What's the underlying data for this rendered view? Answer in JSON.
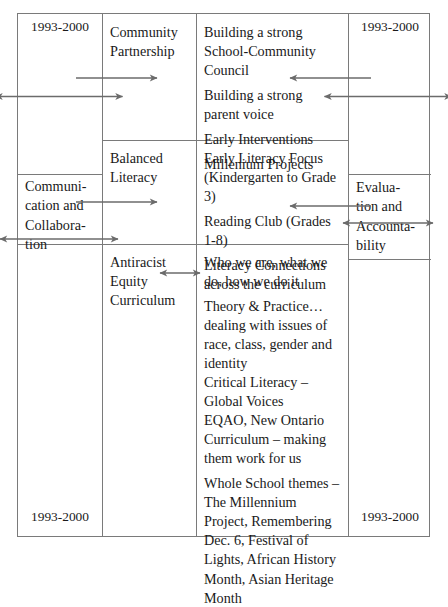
{
  "document": {
    "type": "table-diagram",
    "title": "School improvement planning framework table",
    "colors": {
      "border": "#7a7a7a",
      "text": "#1a1a1a",
      "arrow": "#6b6b6b",
      "background": "#ffffff"
    }
  },
  "table": {
    "left_column": {
      "year_top": "1993-2000",
      "label": "Communication and Collaboration",
      "label_lines": [
        "Communi-",
        "cation and",
        "Collabora-",
        "tion"
      ],
      "year_bottom": "1993-2000"
    },
    "right_column": {
      "year_top": "1993-2000",
      "label": "Evaluation and Accountability",
      "label_lines": [
        "Evalua-",
        "tion and",
        "Accounta-",
        "bility"
      ],
      "year_bottom": "1993-2000"
    },
    "rows": [
      {
        "theme": "Community Partnership",
        "theme_lines": [
          "Community",
          "Partnership"
        ],
        "items": [
          "Building a strong School-Community Council",
          "Building a strong parent voice",
          "Early Interventions",
          "Millenium Projects"
        ]
      },
      {
        "theme": "Balanced Literacy",
        "theme_lines": [
          "Balanced",
          "Literacy"
        ],
        "items": [
          "Early Literacy Focus (Kindergarten to Grade 3)",
          "Reading Club (Grades 1-8)",
          "Literacy Connections across the curriculum"
        ]
      },
      {
        "theme": "Antiracist Equity Curriculum",
        "theme_lines": [
          "Antiracist",
          "Equity",
          "Curriculum"
        ],
        "items": [
          "Who we are, what we do, how we do it",
          "Theory & Practice… dealing with issues of race, class, gender and identity",
          "Critical Literacy – Global Voices",
          "EQAO, New Ontario Curriculum – making them work for us",
          "Whole School themes – The Millennium Project, Remembering Dec. 6, Festival of Lights, African History Month, Asian Heritage Month"
        ]
      }
    ]
  },
  "arrows": [
    {
      "name": "left-vertical-double-arrow-top",
      "direction": "vertical-double"
    },
    {
      "name": "left-vertical-double-arrow-bottom",
      "direction": "vertical-double"
    },
    {
      "name": "right-vertical-double-arrow-top",
      "direction": "vertical-double"
    },
    {
      "name": "right-vertical-double-arrow-bottom",
      "direction": "vertical-double"
    },
    {
      "name": "left-horizontal-arrow-top",
      "direction": "right"
    },
    {
      "name": "left-horizontal-arrow-bottom",
      "direction": "right"
    },
    {
      "name": "right-horizontal-arrow-top",
      "direction": "left"
    },
    {
      "name": "right-horizontal-arrow-bottom",
      "direction": "left"
    },
    {
      "name": "antiracist-vertical-double-arrow",
      "direction": "vertical-double"
    }
  ]
}
